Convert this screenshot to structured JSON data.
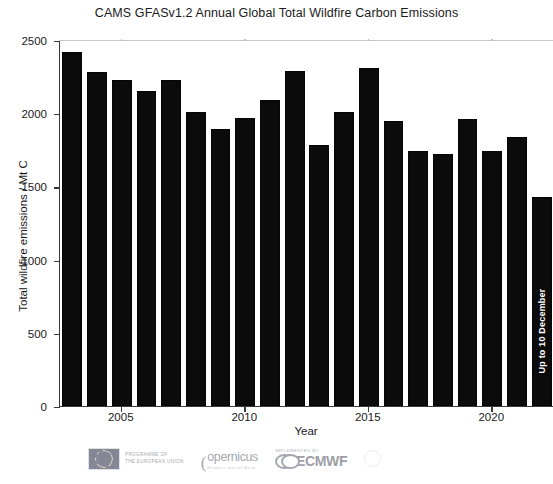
{
  "chart_data": {
    "type": "bar",
    "title": "CAMS GFASv1.2 Annual Global Total Wildfire Carbon Emissions",
    "xlabel": "Year",
    "ylabel": "Total wildfire emissions / Mt C",
    "ylim": [
      0,
      2500
    ],
    "yticks": [
      0,
      500,
      1000,
      1500,
      2000,
      2500
    ],
    "ytick_labels": [
      "0",
      "500",
      "1000",
      "1500",
      "2000",
      "2500"
    ],
    "xticks": [
      2005,
      2010,
      2015,
      2020
    ],
    "xtick_labels": [
      "2005",
      "2010",
      "2015",
      "2020"
    ],
    "xlim": [
      2002.5,
      2022.5
    ],
    "grid": false,
    "legend": null,
    "bar_color": "#0b0b0b",
    "categories": [
      2003,
      2004,
      2005,
      2006,
      2007,
      2008,
      2009,
      2010,
      2011,
      2012,
      2013,
      2014,
      2015,
      2016,
      2017,
      2018,
      2019,
      2020,
      2021,
      2022
    ],
    "values": [
      2420,
      2280,
      2230,
      2150,
      2230,
      2010,
      1890,
      1970,
      2090,
      2290,
      1780,
      2010,
      2310,
      1950,
      1740,
      1720,
      1960,
      1740,
      1840,
      1430
    ],
    "annotations": [
      {
        "bar_index": 19,
        "text": "Up to 10 December",
        "orientation": "vertical",
        "color": "#ffffff"
      }
    ]
  },
  "footer": {
    "eu": {
      "line1": "Programme of",
      "line2": "the European Union",
      "flag_alt": "eu-flag-icon"
    },
    "copernicus": {
      "mark": "(",
      "word": "opernicus",
      "sub": "Europe's eyes on Earth"
    },
    "ecmwf": {
      "pre": "Implemented by",
      "word": "ECMWF"
    },
    "fourth": {
      "line1": "",
      "line2": ""
    }
  }
}
